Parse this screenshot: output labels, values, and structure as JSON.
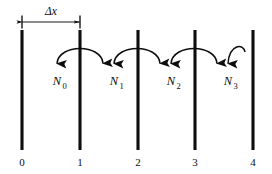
{
  "figure": {
    "background_color": "#ffffff",
    "stroke_color": "#0d0d0d",
    "width": 272,
    "height": 174
  },
  "dimension": {
    "label": "Δx",
    "from_node": "0",
    "to_node": "1",
    "label_x": 51,
    "label_y": 15,
    "line_y": 22,
    "x_start": 22,
    "x_end": 80
  },
  "nodes": [
    {
      "label": "0",
      "x": 22,
      "top": 30,
      "bottom": 150,
      "num_y": 165
    },
    {
      "label": "1",
      "x": 80,
      "top": 30,
      "bottom": 150,
      "num_y": 165
    },
    {
      "label": "2",
      "x": 138,
      "top": 30,
      "bottom": 150,
      "num_y": 165
    },
    {
      "label": "3",
      "x": 195,
      "top": 30,
      "bottom": 150,
      "num_y": 165
    },
    {
      "label": "4",
      "x": 253,
      "top": 30,
      "bottom": 150,
      "num_y": 165
    }
  ],
  "flux_arrows": [
    {
      "symbol": "N",
      "subscript": "0",
      "label": "N0",
      "over_node": "1",
      "arc_left_x": 57,
      "arc_right_x": 104,
      "arc_apex_y": 42,
      "arc_base_y": 62,
      "arrow_tip_y": 70,
      "label_x": 57,
      "label_y": 84
    },
    {
      "symbol": "N",
      "subscript": "1",
      "label": "N1",
      "over_node": "2",
      "arc_left_x": 114,
      "arc_right_x": 161,
      "arc_apex_y": 42,
      "arc_base_y": 62,
      "arrow_tip_y": 70,
      "label_x": 114,
      "label_y": 84
    },
    {
      "symbol": "N",
      "subscript": "2",
      "label": "N2",
      "over_node": "3",
      "arc_left_x": 171,
      "arc_right_x": 218,
      "arc_apex_y": 42,
      "arc_base_y": 62,
      "arrow_tip_y": 70,
      "label_x": 171,
      "label_y": 84
    },
    {
      "symbol": "N",
      "subscript": "3",
      "label": "N3",
      "over_node": "4",
      "arc_left_x": 228,
      "arc_right_x": 228,
      "arc_apex_y": 42,
      "arc_base_y": 62,
      "arrow_tip_y": 70,
      "label_x": 228,
      "label_y": 84
    }
  ]
}
